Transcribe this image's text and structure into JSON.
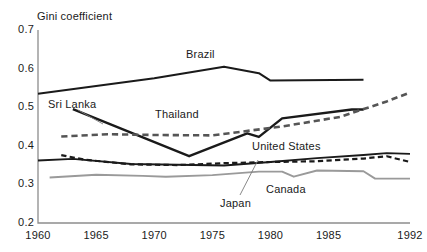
{
  "chart_data": {
    "type": "line",
    "title": "",
    "ylabel": "Gini coefficient",
    "xlabel": "",
    "xlim": [
      1960,
      1992
    ],
    "ylim": [
      0.2,
      0.7
    ],
    "ytick_labels": [
      "0.7",
      "0.6",
      "0.5",
      "0.4",
      "0.3",
      "0.2"
    ],
    "ytick_values": [
      0.7,
      0.6,
      0.5,
      0.4,
      0.3,
      0.2
    ],
    "xtick_labels": [
      "1960",
      "1965",
      "1970",
      "1975",
      "1980",
      "1985",
      "1992"
    ],
    "xtick_values": [
      1960,
      1965,
      1970,
      1975,
      1980,
      1985,
      1992
    ],
    "grid": false,
    "legend_position": "inline-annotations",
    "series": [
      {
        "name": "Brazil",
        "style": "solid",
        "color": "#1a1a1a",
        "width": 2.1,
        "x": [
          1960,
          1970,
          1976,
          1979,
          1980,
          1988
        ],
        "values": [
          0.535,
          0.575,
          0.605,
          0.588,
          0.569,
          0.571
        ]
      },
      {
        "name": "Sri Lanka",
        "style": "solid",
        "color": "#1a1a1a",
        "width": 2.4,
        "x": [
          1963,
          1973,
          1978,
          1979,
          1981,
          1987,
          1988
        ],
        "values": [
          0.495,
          0.373,
          0.432,
          0.423,
          0.471,
          0.494,
          0.494
        ]
      },
      {
        "name": "Thailand",
        "style": "dashed",
        "color": "#555555",
        "width": 2.6,
        "x": [
          1962,
          1966,
          1970,
          1975,
          1981,
          1986,
          1990,
          1992
        ],
        "values": [
          0.424,
          0.43,
          0.428,
          0.427,
          0.45,
          0.475,
          0.515,
          0.538
        ]
      },
      {
        "name": "United States",
        "style": "solid",
        "color": "#1a1a1a",
        "width": 1.9,
        "x": [
          1960,
          1963,
          1968,
          1972,
          1976,
          1980,
          1984,
          1988,
          1990,
          1992
        ],
        "values": [
          0.362,
          0.366,
          0.353,
          0.351,
          0.349,
          0.358,
          0.368,
          0.376,
          0.381,
          0.379
        ]
      },
      {
        "name": "Japan",
        "style": "dashed",
        "color": "#1a1a1a",
        "width": 2.2,
        "x": [
          1962,
          1964,
          1968,
          1972,
          1976,
          1980,
          1984,
          1988,
          1990,
          1992
        ],
        "values": [
          0.376,
          0.364,
          0.352,
          0.35,
          0.355,
          0.358,
          0.36,
          0.367,
          0.373,
          0.358
        ]
      },
      {
        "name": "Canada",
        "style": "solid",
        "color": "#9a9a9a",
        "width": 1.9,
        "x": [
          1961,
          1965,
          1969,
          1971,
          1975,
          1979,
          1981,
          1982,
          1984,
          1988,
          1989,
          1992
        ],
        "values": [
          0.318,
          0.325,
          0.322,
          0.32,
          0.324,
          0.333,
          0.333,
          0.32,
          0.336,
          0.334,
          0.315,
          0.315
        ]
      }
    ],
    "annotations": [
      {
        "label": "Brazil",
        "x_px": 186,
        "y_px": 48
      },
      {
        "label": "Sri Lanka",
        "x_px": 48,
        "y_px": 98
      },
      {
        "label": "Thailand",
        "x_px": 155,
        "y_px": 108
      },
      {
        "label": "United States",
        "x_px": 252,
        "y_px": 140
      },
      {
        "label": "Canada",
        "x_px": 266,
        "y_px": 183
      },
      {
        "label": "Japan",
        "x_px": 220,
        "y_px": 197
      }
    ]
  }
}
